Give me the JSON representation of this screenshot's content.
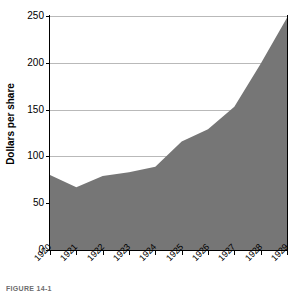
{
  "chart_data": {
    "type": "area",
    "title": "",
    "xlabel": "",
    "ylabel": "Dollars per share",
    "categories": [
      "1920",
      "1921",
      "1922",
      "1923",
      "1924",
      "1925",
      "1926",
      "1927",
      "1928",
      "1929"
    ],
    "values": [
      80,
      67,
      79,
      83,
      89,
      116,
      129,
      153,
      199,
      248
    ],
    "series": [
      {
        "name": "Dollars per share",
        "values": [
          80,
          67,
          79,
          83,
          89,
          116,
          129,
          153,
          199,
          248
        ]
      }
    ],
    "ylim": [
      0,
      250
    ],
    "yticks": [
      0,
      50,
      100,
      150,
      200,
      250
    ],
    "ytick_labels": [
      "0",
      "50",
      "100",
      "150",
      "200",
      "250"
    ],
    "xtick_labels": [
      "1920",
      "1921",
      "1922",
      "1923",
      "1924",
      "1925",
      "1926",
      "1927",
      "1928",
      "1929"
    ],
    "grid": true,
    "grid_axis": "y",
    "legend": "none",
    "fill_color": "#767676",
    "grid_color": "#b9b9b9",
    "axis_color": "#000000",
    "background": "#ffffff",
    "xtick_rotation": -45
  },
  "caption": {
    "text": "FIGURE 14-1"
  }
}
